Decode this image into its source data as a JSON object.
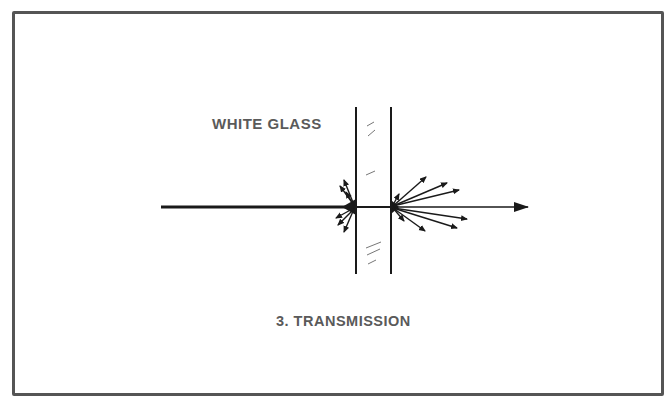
{
  "diagram": {
    "glass_label": "WHITE GLASS",
    "caption": "3. TRANSMISSION",
    "colors": {
      "frame": "#555555",
      "ink": "#1a1a1a",
      "label": "#5a5a5a"
    }
  }
}
